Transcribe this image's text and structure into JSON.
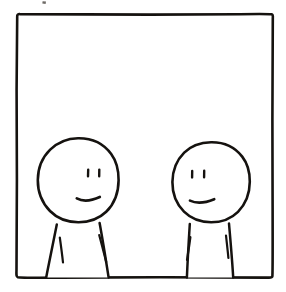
{
  "artwork": {
    "title": "Two Figures In A Panel",
    "medium": "hand-drawn ink comic panel",
    "caption": "",
    "background_color": "#ffffff",
    "ink_color": "#15120f",
    "canvas": {
      "width": 286,
      "height": 292
    }
  },
  "panel": {
    "name": "comic-frame",
    "style": "wobbly hand-inked square border",
    "stroke_color": "#15120f",
    "stroke_width": 2.6,
    "fill_color": "#ffffff",
    "bounds": {
      "left": 16,
      "top": 14,
      "right": 273,
      "bottom": 278
    }
  },
  "stray_mark": {
    "label": "stray ink speck above frame",
    "x": 43,
    "y": 2,
    "width": 4,
    "height": 3,
    "color": "#6e6a66"
  },
  "figures": [
    {
      "id": "left-figure",
      "label": "Left character",
      "expression": "frown",
      "head": {
        "cx": 78,
        "cy": 180,
        "rx": 40,
        "ry": 42
      },
      "eyes": {
        "left": {
          "x": 88,
          "y": 173
        },
        "right": {
          "x": 99,
          "y": 173
        },
        "length": 7,
        "width": 2.4,
        "shape": "vertical dash"
      },
      "mouth": {
        "start_x": 77,
        "start_y": 199,
        "end_x": 100,
        "end_y": 197,
        "curve": "slight downward frown",
        "width": 2.6
      },
      "body": {
        "shape": "trapezoid torso",
        "neck_left_x": 56,
        "neck_right_x": 99,
        "hem_left_x": 46,
        "hem_right_x": 108,
        "top_y": 222,
        "bottom_y": 277
      },
      "arms": [
        {
          "x1": 60,
          "y1": 238,
          "x2": 63,
          "y2": 262
        },
        {
          "x1": 99,
          "y1": 236,
          "x2": 106,
          "y2": 262
        }
      ]
    },
    {
      "id": "right-figure",
      "label": "Right character",
      "expression": "frown",
      "head": {
        "cx": 211,
        "cy": 182,
        "rx": 39,
        "ry": 40
      },
      "eyes": {
        "left": {
          "x": 192,
          "y": 174
        },
        "right": {
          "x": 204,
          "y": 174
        },
        "length": 7,
        "width": 2.4,
        "shape": "vertical dash"
      },
      "mouth": {
        "start_x": 190,
        "start_y": 201,
        "end_x": 214,
        "end_y": 199,
        "curve": "slight downward frown",
        "width": 2.6
      },
      "body": {
        "shape": "near-rectangular torso",
        "neck_left_x": 189,
        "neck_right_x": 229,
        "hem_left_x": 187,
        "hem_right_x": 233,
        "top_y": 222,
        "bottom_y": 277
      },
      "arms": [
        {
          "x1": 190,
          "y1": 238,
          "x2": 187,
          "y2": 260
        },
        {
          "x1": 226,
          "y1": 236,
          "x2": 228,
          "y2": 258
        }
      ]
    }
  ]
}
